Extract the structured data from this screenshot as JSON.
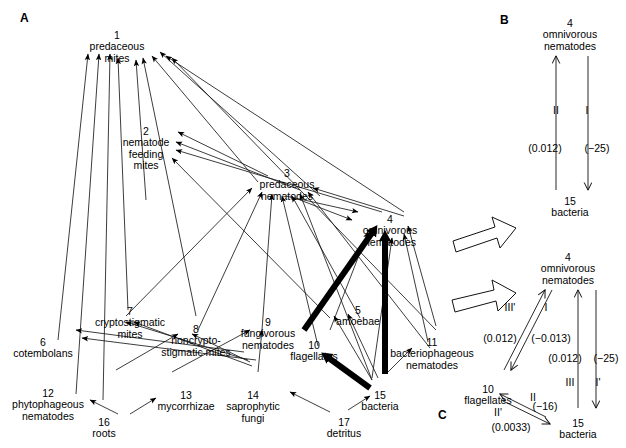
{
  "panels": {
    "a_letter": "A",
    "b_letter": "B",
    "c_letter": "C"
  },
  "panel_a": {
    "nodes": [
      {
        "id": 1,
        "num": "1",
        "name": "predaceous\nmites",
        "x": 117,
        "y": 30
      },
      {
        "id": 2,
        "num": "2",
        "name": "nematode\nfeeding\nmites",
        "x": 146,
        "y": 126
      },
      {
        "id": 3,
        "num": "3",
        "name": "predaceous\nnematodes",
        "x": 287,
        "y": 168
      },
      {
        "id": 4,
        "num": "4",
        "name": "omnivorous\nnematodes",
        "x": 390,
        "y": 214
      },
      {
        "id": 5,
        "num": "5",
        "name": "amoebae",
        "x": 358,
        "y": 305
      },
      {
        "id": 6,
        "num": "6",
        "name": "cotembolans",
        "x": 43,
        "y": 337
      },
      {
        "id": 7,
        "num": "7",
        "name": "cryptostigmatic\nmites",
        "x": 130,
        "y": 306
      },
      {
        "id": 8,
        "num": "8",
        "name": "noncrypto-\nstigmatic mites",
        "x": 196,
        "y": 324
      },
      {
        "id": 9,
        "num": "9",
        "name": "fungivorous\nnematodes",
        "x": 268,
        "y": 317
      },
      {
        "id": 10,
        "num": "10",
        "name": "flagellates",
        "x": 314,
        "y": 340
      },
      {
        "id": 11,
        "num": "11",
        "name": "bacteriophageous\nnematodes",
        "x": 432,
        "y": 337
      },
      {
        "id": 12,
        "num": "12",
        "name": "phytophageous\nnematodes",
        "x": 48,
        "y": 388
      },
      {
        "id": 13,
        "num": "13",
        "name": "mycorrhizae",
        "x": 186,
        "y": 390
      },
      {
        "id": 14,
        "num": "14",
        "name": "saprophytic\nfungi",
        "x": 253,
        "y": 390
      },
      {
        "id": 15,
        "num": "15",
        "name": "bacteria",
        "x": 380,
        "y": 390
      },
      {
        "id": 16,
        "num": "16",
        "name": "roots",
        "x": 104,
        "y": 417
      },
      {
        "id": 17,
        "num": "17",
        "name": "detritus",
        "x": 344,
        "y": 417
      }
    ]
  },
  "panel_b": {
    "nodes": [
      {
        "id": "b-top",
        "num": "4",
        "name": "omnivorous\nnematodes",
        "x": 570,
        "y": 18
      },
      {
        "id": "b-bottom",
        "num": "15",
        "name": "bacteria",
        "x": 570,
        "y": 196
      }
    ],
    "romans": [
      {
        "text": "II",
        "x": 556,
        "y": 110
      },
      {
        "text": "I",
        "x": 587,
        "y": 110
      }
    ],
    "values": [
      {
        "text": "(0.012)",
        "x": 545,
        "y": 148
      },
      {
        "text": "(−25)",
        "x": 597,
        "y": 148
      }
    ]
  },
  "panel_c": {
    "nodes": [
      {
        "id": "c-top",
        "num": "4",
        "name": "omnivorous\nnematodes",
        "x": 568,
        "y": 252
      },
      {
        "id": "c-left",
        "num": "10",
        "name": "flagellates",
        "x": 488,
        "y": 384
      },
      {
        "id": "c-right",
        "num": "15",
        "name": "bacteria",
        "x": 578,
        "y": 418
      }
    ],
    "romans": [
      {
        "text": "III'",
        "x": 510,
        "y": 307
      },
      {
        "text": "I",
        "x": 546,
        "y": 307
      },
      {
        "text": "III",
        "x": 570,
        "y": 382
      },
      {
        "text": "I'",
        "x": 598,
        "y": 382
      },
      {
        "text": "II",
        "x": 533,
        "y": 397
      },
      {
        "text": "II'",
        "x": 498,
        "y": 412
      }
    ],
    "values": [
      {
        "text": "(0.012)",
        "x": 500,
        "y": 338
      },
      {
        "text": "(−0.013)",
        "x": 551,
        "y": 338
      },
      {
        "text": "(0.012)",
        "x": 565,
        "y": 358
      },
      {
        "text": "(−25)",
        "x": 606,
        "y": 358
      },
      {
        "text": "(−16)",
        "x": 545,
        "y": 406
      },
      {
        "text": "(0.0033)",
        "x": 511,
        "y": 427
      }
    ]
  },
  "colors": {
    "ink": "#000000",
    "background": "#ffffff",
    "thin_line": "#2b2b2b"
  }
}
